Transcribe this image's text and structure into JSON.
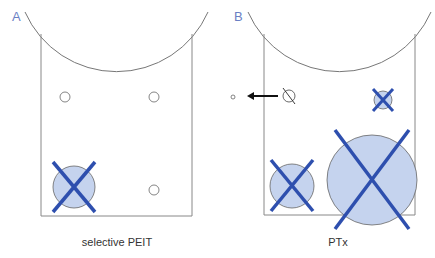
{
  "panels": [
    {
      "id": "A",
      "label": "A",
      "caption": "selective PEIT"
    },
    {
      "id": "B",
      "label": "B",
      "caption": "PTx"
    }
  ],
  "colors": {
    "outline": "#777777",
    "lesion_fill": "#c5d3ee",
    "cross": "#2e4fae",
    "label": "#6a7fc4"
  }
}
